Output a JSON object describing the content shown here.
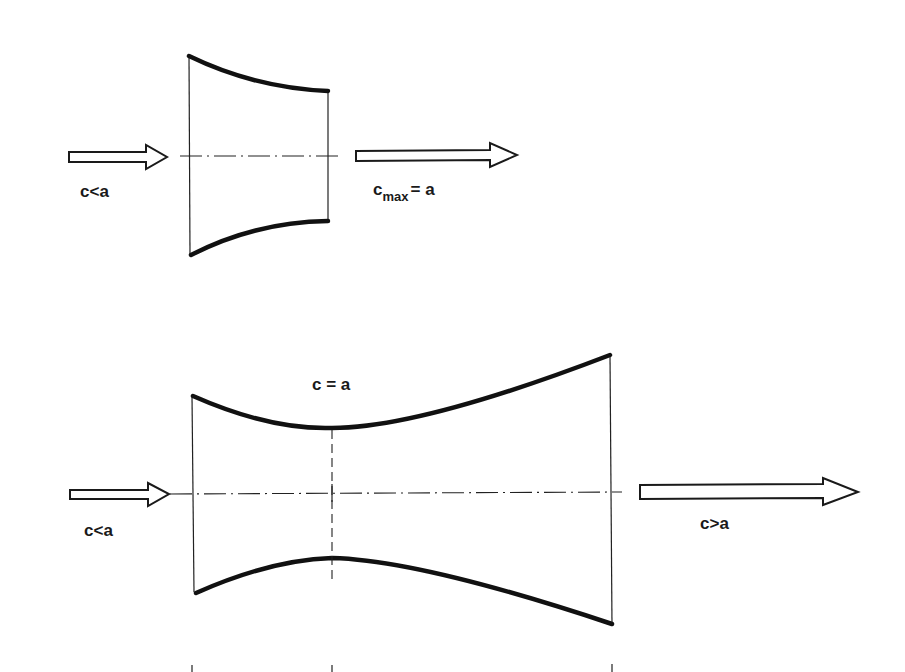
{
  "diagram": {
    "top_nozzle": {
      "type": "converging-nozzle",
      "inlet_label": "c<a",
      "outlet_label": {
        "base": "c",
        "subscript": "max",
        "rest": "= a"
      }
    },
    "bottom_nozzle": {
      "type": "laval-nozzle",
      "throat_label": "c = a",
      "inlet_label": "c<a",
      "outlet_label": "c>a"
    },
    "colors": {
      "line": "#111111",
      "background": "#ffffff"
    }
  }
}
